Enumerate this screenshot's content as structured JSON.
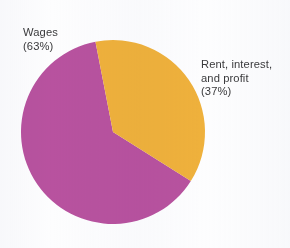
{
  "chart_data": {
    "type": "pie",
    "title": "",
    "subtitle": "",
    "xlabel": "",
    "ylabel": "",
    "legend_position": "none",
    "grid": false,
    "labels_inline": true,
    "categories": [
      "Wages",
      "Rent, interest, and profit"
    ],
    "values": [
      63,
      37
    ],
    "unit": "percent",
    "total": 100,
    "slices": [
      {
        "name": "Wages",
        "value": 63,
        "value_text": "(63%)",
        "color": "#b8529f",
        "label_lines": [
          "Wages",
          "(63%)"
        ],
        "label_position": "upper-left-outside"
      },
      {
        "name": "Rent, interest, and profit",
        "value": 37,
        "value_text": "(37%)",
        "color": "#efb13c",
        "label_lines": [
          "Rent, interest,",
          "and profit",
          "(37%)"
        ],
        "label_position": "right-outside"
      }
    ]
  },
  "geometry": {
    "center_x": 113,
    "center_y": 132,
    "radius": 92,
    "start_angle_deg": -11
  },
  "colors": {
    "wages": "#b8529f",
    "rent_interest_profit": "#efb13c",
    "text": "#3a3a3c",
    "background": "#fdfdfe"
  },
  "labels": {
    "wages": {
      "line1": "Wages",
      "line2": "(63%)"
    },
    "rent": {
      "line1": "Rent, interest,",
      "line2": "and profit",
      "line3": "(37%)"
    }
  }
}
